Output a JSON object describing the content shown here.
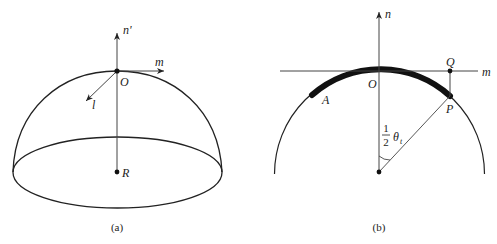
{
  "figure_a": {
    "caption": "(a)",
    "labels": {
      "normal_axis": "n'",
      "tangent_axis": "m",
      "oblique_axis": "l",
      "apex_point": "O",
      "center_point": "R"
    }
  },
  "figure_b": {
    "caption": "(b)",
    "labels": {
      "normal_axis": "n",
      "tangent_axis": "m",
      "apex_point": "O",
      "projection_point": "Q",
      "arc_end_point": "P",
      "arc_start_point": "A",
      "angle_numerator": "1",
      "angle_denominator": "2",
      "angle_symbol": "θ",
      "angle_subscript": "t"
    }
  },
  "colors": {
    "stroke": "#222222",
    "background": "#ffffff"
  }
}
